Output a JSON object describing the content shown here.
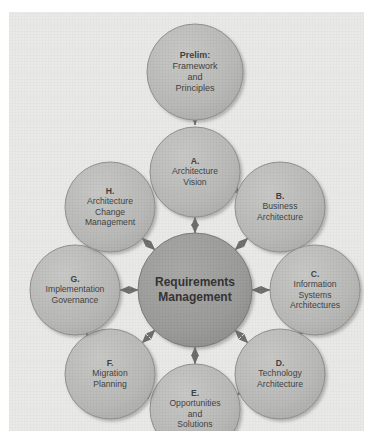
{
  "diagram": {
    "type": "hub-and-spoke cycle diagram",
    "colors": {
      "background": "#e9e9e7",
      "phase_node_fill": "#b9b9b7",
      "phase_node_stroke": "#8e8e8c",
      "hub_node_fill": "#9a9a98",
      "hub_node_stroke": "#79797a",
      "arrow": "#6e6e6e",
      "text": "#3c3c3c"
    },
    "hub": {
      "id": "requirements-management",
      "lines": [
        "Requirements",
        "Management"
      ],
      "cx": 186,
      "cy": 278,
      "r": 57
    },
    "entry_node": {
      "id": "prelim",
      "lines": [
        "Prelim:",
        "Framework",
        "and",
        "Principles"
      ],
      "bold_first_line": true,
      "cx": 186,
      "cy": 60,
      "r": 48
    },
    "phases": [
      {
        "id": "phase-a",
        "letter": "A.",
        "lines": [
          "Architecture",
          "Vision"
        ],
        "cx": 186,
        "cy": 160,
        "r": 45
      },
      {
        "id": "phase-b",
        "letter": "B.",
        "lines": [
          "Business",
          "Architecture"
        ],
        "cx": 271,
        "cy": 195,
        "r": 45
      },
      {
        "id": "phase-c",
        "letter": "C.",
        "lines": [
          "Information",
          "Systems",
          "Architectures"
        ],
        "cx": 306,
        "cy": 278,
        "r": 45
      },
      {
        "id": "phase-d",
        "letter": "D.",
        "lines": [
          "Technology",
          "Architecture"
        ],
        "cx": 271,
        "cy": 362,
        "r": 45
      },
      {
        "id": "phase-e",
        "letter": "E.",
        "lines": [
          "Opportunities",
          "and",
          "Solutions"
        ],
        "cx": 186,
        "cy": 397,
        "r": 45
      },
      {
        "id": "phase-f",
        "letter": "F.",
        "lines": [
          "Migration",
          "Planning"
        ],
        "cx": 101,
        "cy": 362,
        "r": 45
      },
      {
        "id": "phase-g",
        "letter": "G.",
        "lines": [
          "Implementation",
          "Governance"
        ],
        "cx": 66,
        "cy": 278,
        "r": 45
      },
      {
        "id": "phase-h",
        "letter": "H.",
        "lines": [
          "Architecture",
          "Change",
          "Management"
        ],
        "cx": 101,
        "cy": 195,
        "r": 45
      }
    ],
    "connections": {
      "entry_to_phase_a": {
        "style": "single-arrow",
        "from": "prelim",
        "to": "phase-a"
      },
      "ring_order": [
        "phase-a",
        "phase-b",
        "phase-c",
        "phase-d",
        "phase-e",
        "phase-f",
        "phase-g",
        "phase-h"
      ],
      "ring_style": "single-arrow-clockwise",
      "spoke_style": "double-arrow"
    }
  }
}
